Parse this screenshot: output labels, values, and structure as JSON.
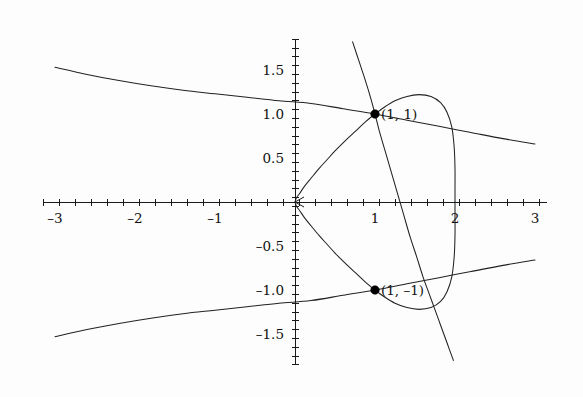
{
  "chart_data": {
    "type": "line",
    "title": "",
    "subtitle": "",
    "xlabel": "",
    "ylabel": "",
    "xlim": [
      -3.15,
      3.15
    ],
    "ylim": [
      -1.85,
      1.85
    ],
    "grid": false,
    "legend": "none",
    "background_color": "#fdfdfd",
    "curve_color": "#222222",
    "axis_color": "#1a1a1a",
    "point_color": "#000000",
    "x_ticks_major": [
      -3,
      -2,
      -1,
      0,
      1,
      2,
      3
    ],
    "x_tick_labels": [
      "-3",
      "-2",
      "-1",
      "",
      "1",
      "2",
      "3"
    ],
    "x_tick_minor_step": 0.2,
    "y_ticks_major": [
      -1.5,
      -1.0,
      -0.5,
      0.5,
      1.0,
      1.5
    ],
    "y_tick_labels": [
      "-1.5",
      "-1.0",
      "-0.5",
      "0.5",
      "1.0",
      "1.5"
    ],
    "y_tick_minor_step": 0.1,
    "annotations": [
      {
        "label": "(1, 1)",
        "x": 1,
        "y": 1,
        "marker": "filled-circle"
      },
      {
        "label": "(1, -1)",
        "x": 1,
        "y": -1,
        "marker": "filled-circle"
      }
    ],
    "series": [
      {
        "name": "loop-upper",
        "comment": "closed-loop branch: cusp at origin, rises to x=2 vertical tangent",
        "points": [
          [
            0,
            0
          ],
          [
            0.02,
            0.05
          ],
          [
            0.06,
            0.1
          ],
          [
            0.12,
            0.18
          ],
          [
            0.2,
            0.27
          ],
          [
            0.3,
            0.38
          ],
          [
            0.4,
            0.48
          ],
          [
            0.5,
            0.58
          ],
          [
            0.62,
            0.69
          ],
          [
            0.75,
            0.8
          ],
          [
            0.88,
            0.91
          ],
          [
            1.0,
            1.0
          ],
          [
            1.12,
            1.08
          ],
          [
            1.25,
            1.15
          ],
          [
            1.4,
            1.2
          ],
          [
            1.55,
            1.22
          ],
          [
            1.7,
            1.2
          ],
          [
            1.82,
            1.13
          ],
          [
            1.9,
            1.02
          ],
          [
            1.96,
            0.85
          ],
          [
            1.99,
            0.62
          ],
          [
            2.0,
            0.38
          ],
          [
            2.0,
            0.15
          ],
          [
            2.0,
            0
          ]
        ]
      },
      {
        "name": "loop-lower",
        "comment": "mirror of loop-upper below the x-axis",
        "points": [
          [
            0,
            0
          ],
          [
            0.02,
            -0.05
          ],
          [
            0.06,
            -0.1
          ],
          [
            0.12,
            -0.18
          ],
          [
            0.2,
            -0.27
          ],
          [
            0.3,
            -0.38
          ],
          [
            0.4,
            -0.48
          ],
          [
            0.5,
            -0.58
          ],
          [
            0.62,
            -0.69
          ],
          [
            0.75,
            -0.8
          ],
          [
            0.88,
            -0.91
          ],
          [
            1.0,
            -1.0
          ],
          [
            1.12,
            -1.08
          ],
          [
            1.25,
            -1.15
          ],
          [
            1.4,
            -1.2
          ],
          [
            1.55,
            -1.22
          ],
          [
            1.7,
            -1.2
          ],
          [
            1.82,
            -1.13
          ],
          [
            1.9,
            -1.02
          ],
          [
            1.96,
            -0.85
          ],
          [
            1.99,
            -0.62
          ],
          [
            2.0,
            -0.38
          ],
          [
            2.0,
            -0.15
          ],
          [
            2.0,
            0
          ]
        ]
      },
      {
        "name": "shallow-upper",
        "comment": "gently decreasing branch from x=-3 through (1,1) to the right edge",
        "points": [
          [
            -3.0,
            1.53
          ],
          [
            -2.6,
            1.45
          ],
          [
            -2.2,
            1.38
          ],
          [
            -1.8,
            1.32
          ],
          [
            -1.4,
            1.27
          ],
          [
            -1.0,
            1.23
          ],
          [
            -0.6,
            1.19
          ],
          [
            -0.2,
            1.15
          ],
          [
            0.2,
            1.12
          ],
          [
            0.6,
            1.06
          ],
          [
            1.0,
            1.0
          ],
          [
            1.4,
            0.93
          ],
          [
            1.8,
            0.86
          ],
          [
            2.2,
            0.79
          ],
          [
            2.6,
            0.72
          ],
          [
            3.0,
            0.66
          ]
        ]
      },
      {
        "name": "shallow-lower",
        "comment": "mirror of shallow-upper below the x-axis",
        "points": [
          [
            -3.0,
            -1.53
          ],
          [
            -2.6,
            -1.45
          ],
          [
            -2.2,
            -1.38
          ],
          [
            -1.8,
            -1.32
          ],
          [
            -1.4,
            -1.27
          ],
          [
            -1.0,
            -1.23
          ],
          [
            -0.6,
            -1.19
          ],
          [
            -0.2,
            -1.15
          ],
          [
            0.2,
            -1.12
          ],
          [
            0.6,
            -1.06
          ],
          [
            1.0,
            -1.0
          ],
          [
            1.4,
            -0.93
          ],
          [
            1.8,
            -0.86
          ],
          [
            2.2,
            -0.79
          ],
          [
            2.6,
            -0.72
          ],
          [
            3.0,
            -0.66
          ]
        ]
      },
      {
        "name": "steep-line",
        "comment": "steep descending straight-ish line through (1,1) and (1,-1) region",
        "points": [
          [
            0.72,
            1.82
          ],
          [
            0.8,
            1.6
          ],
          [
            0.88,
            1.38
          ],
          [
            0.95,
            1.17
          ],
          [
            1.0,
            1.0
          ],
          [
            1.05,
            0.82
          ],
          [
            1.12,
            0.6
          ],
          [
            1.2,
            0.35
          ],
          [
            1.28,
            0.1
          ],
          [
            1.36,
            -0.15
          ],
          [
            1.44,
            -0.4
          ],
          [
            1.52,
            -0.62
          ],
          [
            1.6,
            -0.85
          ],
          [
            1.68,
            -1.05
          ],
          [
            1.74,
            -1.2
          ],
          [
            1.82,
            -1.4
          ],
          [
            1.9,
            -1.6
          ],
          [
            1.98,
            -1.8
          ]
        ]
      }
    ]
  },
  "figure": {
    "origin_px": {
      "x": 295,
      "y": 202
    },
    "scale_px_per_unit": {
      "x": 80,
      "y": 88
    }
  }
}
